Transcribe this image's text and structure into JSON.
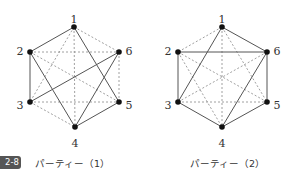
{
  "figure": {
    "badge": "2-8",
    "graphs": [
      {
        "caption": "パーティー（1）",
        "nodes": [
          {
            "id": "1",
            "x": 74,
            "y": 27,
            "lx": 74,
            "ly": 20
          },
          {
            "id": "2",
            "x": 30,
            "y": 52,
            "lx": 20,
            "ly": 52
          },
          {
            "id": "3",
            "x": 30,
            "y": 102,
            "lx": 20,
            "ly": 106
          },
          {
            "id": "4",
            "x": 75,
            "y": 127,
            "lx": 75,
            "ly": 144
          },
          {
            "id": "5",
            "x": 119,
            "y": 102,
            "lx": 129,
            "ly": 106
          },
          {
            "id": "6",
            "x": 119,
            "y": 52,
            "lx": 129,
            "ly": 52
          }
        ],
        "solid_edges": [
          [
            "1",
            "2"
          ],
          [
            "1",
            "5"
          ],
          [
            "2",
            "3"
          ],
          [
            "2",
            "4"
          ],
          [
            "3",
            "6"
          ],
          [
            "4",
            "6"
          ],
          [
            "4",
            "5"
          ]
        ],
        "dashed_edges": [
          [
            "1",
            "6"
          ],
          [
            "1",
            "3"
          ],
          [
            "1",
            "4"
          ],
          [
            "2",
            "6"
          ],
          [
            "2",
            "5"
          ],
          [
            "3",
            "5"
          ],
          [
            "3",
            "4"
          ],
          [
            "5",
            "6"
          ]
        ]
      },
      {
        "caption": "パーティー（2）",
        "nodes": [
          {
            "id": "1",
            "x": 222,
            "y": 27,
            "lx": 222,
            "ly": 20
          },
          {
            "id": "2",
            "x": 178,
            "y": 52,
            "lx": 168,
            "ly": 52
          },
          {
            "id": "3",
            "x": 178,
            "y": 102,
            "lx": 168,
            "ly": 106
          },
          {
            "id": "4",
            "x": 222,
            "y": 127,
            "lx": 222,
            "ly": 144
          },
          {
            "id": "5",
            "x": 267,
            "y": 102,
            "lx": 277,
            "ly": 106
          },
          {
            "id": "6",
            "x": 267,
            "y": 52,
            "lx": 277,
            "ly": 52
          }
        ],
        "solid_edges": [
          [
            "1",
            "6"
          ],
          [
            "1",
            "3"
          ],
          [
            "2",
            "6"
          ],
          [
            "2",
            "3"
          ],
          [
            "3",
            "4"
          ],
          [
            "4",
            "6"
          ],
          [
            "4",
            "5"
          ],
          [
            "5",
            "6"
          ]
        ],
        "dashed_edges": [
          [
            "1",
            "2"
          ],
          [
            "1",
            "4"
          ],
          [
            "1",
            "5"
          ],
          [
            "2",
            "4"
          ],
          [
            "2",
            "5"
          ],
          [
            "3",
            "5"
          ],
          [
            "3",
            "6"
          ]
        ]
      }
    ],
    "colors": {
      "solid": "#555555",
      "dashed": "#888888",
      "node": "#111111"
    }
  }
}
